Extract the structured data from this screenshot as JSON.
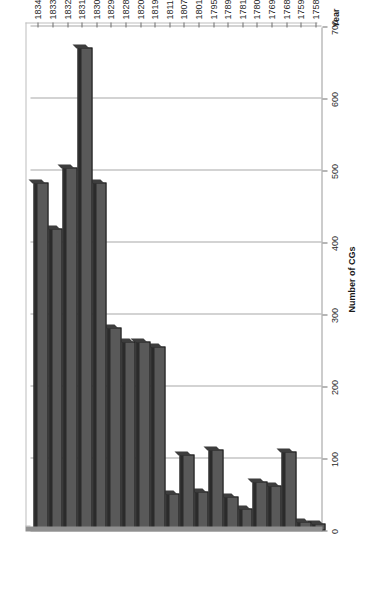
{
  "chart_data": {
    "type": "bar",
    "orientation": "horizontal",
    "title": "",
    "xlabel": "Number of CGs",
    "ylabel": "Year",
    "categories": [
      "1758",
      "1759",
      "1768",
      "1769",
      "1780",
      "1781",
      "1789",
      "1795",
      "1801",
      "1807",
      "1811",
      "1819",
      "1820",
      "1828",
      "1829",
      "1830",
      "1831",
      "1832",
      "1833",
      "1834"
    ],
    "values": [
      10,
      12,
      110,
      63,
      68,
      30,
      47,
      113,
      54,
      106,
      52,
      256,
      262,
      263,
      282,
      483,
      671,
      504,
      420,
      483
    ],
    "value_axis_ticks": [
      "0",
      "100",
      "200",
      "300",
      "400",
      "500",
      "600",
      "700"
    ],
    "value_axis_tick_values": [
      0,
      100,
      200,
      300,
      400,
      500,
      600,
      700
    ],
    "xlim": [
      0,
      700
    ],
    "grid": true,
    "legend": "none",
    "bar_color": "#595959",
    "bar_border_color": "#1a1a1a",
    "gridline_color": "#a8a8a8",
    "axis_color": "#8f8f8f",
    "page_rotation": "-90"
  },
  "axes": {
    "value_axis_title": "Number of CGs",
    "category_axis_title": "Year"
  }
}
